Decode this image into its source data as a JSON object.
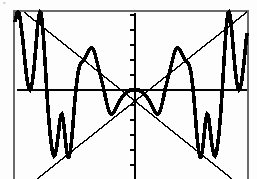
{
  "screen": {
    "kind": "graphing-calculator-plot",
    "background_color": "#fdfdfd",
    "ink_color": "#000000",
    "frame": {
      "left": 14,
      "top": 11,
      "right": 248,
      "bottom": 179,
      "visible_sides": "left-top-right",
      "stroke_width": 1.2
    },
    "top_artifact_text": "• •"
  },
  "chart_data": {
    "type": "line",
    "title": "",
    "subtitle": "",
    "xlabel": "",
    "ylabel": "",
    "grid": false,
    "legend_position": "none",
    "axes": {
      "x_axis": {
        "visible": true,
        "pixel_y": 90,
        "from_pixel_x": 17,
        "to_pixel_x": 247,
        "ticks": false
      },
      "y_axis": {
        "visible": true,
        "pixel_x": 135,
        "from_pixel_y": 13,
        "to_pixel_y": 179,
        "ticks": true,
        "tick_count": 11,
        "tick_spacing_px": 15,
        "tick_length_px": 5
      }
    },
    "xlim": [
      -10.2,
      10.0
    ],
    "ylim": [
      -7.8,
      6.9
    ],
    "origin_px": [
      135,
      90
    ],
    "px_per_unit": {
      "x": 11.6,
      "y": 11.6
    },
    "series": [
      {
        "name": "y = x sin(x)",
        "style": "thick-stepped",
        "stroke_width": 3.6,
        "color": "#000000",
        "points_px": [
          [
            15,
            22
          ],
          [
            16,
            17
          ],
          [
            17,
            13
          ],
          [
            18,
            12
          ],
          [
            19,
            13
          ],
          [
            20,
            18
          ],
          [
            21,
            25
          ],
          [
            22,
            33
          ],
          [
            23,
            42
          ],
          [
            24,
            52
          ],
          [
            25,
            62
          ],
          [
            26,
            71
          ],
          [
            27,
            79
          ],
          [
            28,
            85
          ],
          [
            29,
            89
          ],
          [
            30,
            90
          ],
          [
            31,
            88
          ],
          [
            32,
            84
          ],
          [
            33,
            77
          ],
          [
            34,
            68
          ],
          [
            35,
            57
          ],
          [
            36,
            45
          ],
          [
            37,
            33
          ],
          [
            38,
            22
          ],
          [
            39,
            15
          ],
          [
            40,
            12
          ],
          [
            41,
            13
          ],
          [
            42,
            20
          ],
          [
            43,
            31
          ],
          [
            44,
            45
          ],
          [
            45,
            61
          ],
          [
            46,
            78
          ],
          [
            47,
            94
          ],
          [
            48,
            109
          ],
          [
            49,
            122
          ],
          [
            50,
            133
          ],
          [
            51,
            142
          ],
          [
            52,
            149
          ],
          [
            53,
            154
          ],
          [
            54,
            156
          ],
          [
            55,
            155
          ],
          [
            56,
            151
          ],
          [
            57,
            145
          ],
          [
            58,
            137
          ],
          [
            59,
            128
          ],
          [
            60,
            120
          ],
          [
            61,
            115
          ],
          [
            62,
            114
          ],
          [
            63,
            118
          ],
          [
            64,
            126
          ],
          [
            65,
            136
          ],
          [
            66,
            146
          ],
          [
            67,
            153
          ],
          [
            68,
            157
          ],
          [
            69,
            157
          ],
          [
            70,
            153
          ],
          [
            71,
            146
          ],
          [
            72,
            136
          ],
          [
            73,
            124
          ],
          [
            74,
            111
          ],
          [
            75,
            99
          ],
          [
            76,
            89
          ],
          [
            77,
            80
          ],
          [
            78,
            73
          ],
          [
            79,
            68
          ],
          [
            80,
            65
          ],
          [
            81,
            63
          ],
          [
            82,
            62
          ],
          [
            83,
            61
          ],
          [
            84,
            60
          ],
          [
            85,
            58
          ],
          [
            86,
            56
          ],
          [
            87,
            54
          ],
          [
            88,
            52
          ],
          [
            89,
            50
          ],
          [
            90,
            49
          ],
          [
            91,
            48
          ],
          [
            92,
            48
          ],
          [
            93,
            49
          ],
          [
            94,
            51
          ],
          [
            95,
            54
          ],
          [
            96,
            58
          ],
          [
            97,
            62
          ],
          [
            98,
            66
          ],
          [
            99,
            70
          ],
          [
            100,
            74
          ],
          [
            101,
            78
          ],
          [
            102,
            82
          ],
          [
            103,
            86
          ],
          [
            104,
            90
          ],
          [
            105,
            95
          ],
          [
            106,
            100
          ],
          [
            107,
            104
          ],
          [
            108,
            108
          ],
          [
            109,
            111
          ],
          [
            110,
            113
          ],
          [
            111,
            114
          ],
          [
            112,
            114
          ],
          [
            113,
            113
          ],
          [
            114,
            112
          ],
          [
            115,
            110
          ],
          [
            116,
            108
          ],
          [
            117,
            106
          ],
          [
            118,
            104
          ],
          [
            119,
            102
          ],
          [
            120,
            100
          ],
          [
            121,
            99
          ],
          [
            122,
            97
          ],
          [
            123,
            96
          ],
          [
            124,
            95
          ],
          [
            125,
            94
          ],
          [
            126,
            93
          ],
          [
            127,
            92
          ],
          [
            128,
            91
          ],
          [
            129,
            91
          ],
          [
            130,
            90
          ],
          [
            131,
            90
          ],
          [
            132,
            90
          ],
          [
            133,
            90
          ],
          [
            134,
            90
          ],
          [
            135,
            90
          ],
          [
            136,
            90
          ],
          [
            137,
            90
          ],
          [
            138,
            90
          ],
          [
            139,
            90
          ],
          [
            140,
            91
          ],
          [
            141,
            91
          ],
          [
            142,
            92
          ],
          [
            143,
            93
          ],
          [
            144,
            94
          ],
          [
            145,
            95
          ],
          [
            146,
            96
          ],
          [
            147,
            97
          ],
          [
            148,
            99
          ],
          [
            149,
            100
          ],
          [
            150,
            102
          ],
          [
            151,
            104
          ],
          [
            152,
            106
          ],
          [
            153,
            108
          ],
          [
            154,
            110
          ],
          [
            155,
            112
          ],
          [
            156,
            113
          ],
          [
            157,
            114
          ],
          [
            158,
            114
          ],
          [
            159,
            113
          ],
          [
            160,
            111
          ],
          [
            161,
            108
          ],
          [
            162,
            104
          ],
          [
            163,
            100
          ],
          [
            164,
            95
          ],
          [
            165,
            90
          ],
          [
            166,
            86
          ],
          [
            167,
            82
          ],
          [
            168,
            78
          ],
          [
            169,
            74
          ],
          [
            170,
            70
          ],
          [
            171,
            66
          ],
          [
            172,
            62
          ],
          [
            173,
            58
          ],
          [
            174,
            54
          ],
          [
            175,
            51
          ],
          [
            176,
            49
          ],
          [
            177,
            48
          ],
          [
            178,
            48
          ],
          [
            179,
            49
          ],
          [
            180,
            50
          ],
          [
            181,
            52
          ],
          [
            182,
            54
          ],
          [
            183,
            56
          ],
          [
            184,
            58
          ],
          [
            185,
            60
          ],
          [
            186,
            61
          ],
          [
            187,
            62
          ],
          [
            188,
            63
          ],
          [
            189,
            65
          ],
          [
            190,
            68
          ],
          [
            191,
            73
          ],
          [
            192,
            80
          ],
          [
            193,
            89
          ],
          [
            194,
            99
          ],
          [
            195,
            111
          ],
          [
            196,
            124
          ],
          [
            197,
            136
          ],
          [
            198,
            146
          ],
          [
            199,
            153
          ],
          [
            200,
            157
          ],
          [
            201,
            157
          ],
          [
            202,
            153
          ],
          [
            203,
            146
          ],
          [
            204,
            136
          ],
          [
            205,
            126
          ],
          [
            206,
            118
          ],
          [
            207,
            114
          ],
          [
            208,
            115
          ],
          [
            209,
            120
          ],
          [
            210,
            128
          ],
          [
            211,
            137
          ],
          [
            212,
            145
          ],
          [
            213,
            151
          ],
          [
            214,
            155
          ],
          [
            215,
            156
          ],
          [
            216,
            154
          ],
          [
            217,
            149
          ],
          [
            218,
            142
          ],
          [
            219,
            133
          ],
          [
            220,
            122
          ],
          [
            221,
            109
          ],
          [
            222,
            94
          ],
          [
            223,
            78
          ],
          [
            224,
            61
          ],
          [
            225,
            45
          ],
          [
            226,
            31
          ],
          [
            227,
            20
          ],
          [
            228,
            13
          ],
          [
            229,
            12
          ],
          [
            230,
            15
          ],
          [
            231,
            22
          ],
          [
            232,
            33
          ],
          [
            233,
            45
          ],
          [
            234,
            57
          ],
          [
            235,
            68
          ],
          [
            236,
            77
          ],
          [
            237,
            84
          ],
          [
            238,
            88
          ],
          [
            239,
            90
          ],
          [
            240,
            89
          ],
          [
            241,
            85
          ],
          [
            242,
            79
          ],
          [
            243,
            71
          ],
          [
            244,
            62
          ],
          [
            245,
            52
          ],
          [
            246,
            42
          ],
          [
            247,
            33
          ]
        ]
      },
      {
        "name": "envelope y = x",
        "style": "thin",
        "stroke_width": 1.4,
        "color": "#000000",
        "points_px": [
          [
            37,
            179
          ],
          [
            247,
            12
          ]
        ]
      },
      {
        "name": "envelope y = -x",
        "style": "thin",
        "stroke_width": 1.4,
        "color": "#000000",
        "points_px": [
          [
            24,
            12
          ],
          [
            232,
            179
          ]
        ]
      }
    ],
    "annotations": []
  }
}
